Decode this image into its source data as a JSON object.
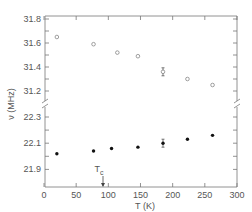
{
  "chart_data": {
    "type": "scatter",
    "title": "",
    "xlabel": "T (K)",
    "ylabel": "ν (MHz)",
    "xlim": [
      0,
      300
    ],
    "x_ticks": [
      0,
      50,
      100,
      150,
      200,
      250,
      300
    ],
    "y_ticks_upper": [
      31.2,
      31.4,
      31.6,
      31.8
    ],
    "y_ticks_lower": [
      21.9,
      22.1,
      22.3
    ],
    "y_axis_broken": true,
    "grid": false,
    "legend": null,
    "annotations": [
      {
        "text": "Tc",
        "x": 90,
        "type": "arrow-down-to-axis"
      }
    ],
    "series": [
      {
        "name": "upper (open circles)",
        "marker": "open-circle",
        "x": [
          20,
          77,
          114,
          146,
          185,
          223,
          262
        ],
        "y": [
          31.65,
          31.59,
          31.52,
          31.49,
          31.36,
          31.3,
          31.25
        ],
        "error_bar_at_index": 4
      },
      {
        "name": "lower (filled circles)",
        "marker": "filled-circle",
        "x": [
          20,
          77,
          105,
          146,
          185,
          223,
          262
        ],
        "y": [
          22.02,
          22.04,
          22.06,
          22.07,
          22.1,
          22.13,
          22.16
        ],
        "error_bar_at_index": 4
      }
    ]
  },
  "labels": {
    "xlabel": "T (K)",
    "ylabel": "ν (MHz)",
    "tc": "T",
    "tc_sub": "c",
    "x_ticks": [
      "0",
      "50",
      "100",
      "150",
      "200",
      "250",
      "300"
    ],
    "y_upper": [
      "31.8",
      "31.6",
      "31.4",
      "31.2"
    ],
    "y_lower": [
      "22.3",
      "22.1",
      "21.9"
    ]
  }
}
